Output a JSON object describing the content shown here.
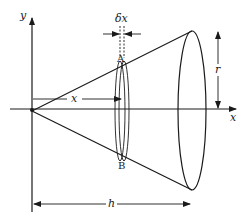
{
  "diagram": {
    "labels": {
      "y_axis": "y",
      "x_axis": "x",
      "slice_thickness": "δx",
      "point_top": "A",
      "point_bottom": "B",
      "distance": "x",
      "radius": "r",
      "height": "h"
    },
    "colors": {
      "ink": "#1a1a1a",
      "background": "#ffffff"
    }
  }
}
